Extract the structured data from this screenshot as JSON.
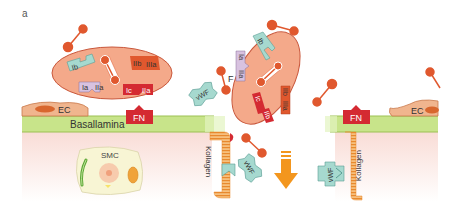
{
  "panel_label": "a",
  "colors": {
    "platelet_fill": "#f4a98a",
    "platelet_stroke": "#c9573b",
    "basallamina": "#c8e48a",
    "fibrinogen": "#e0582e",
    "vwf": "#a6d9cf",
    "fn": "#d42a32",
    "ec": "#f0b58e",
    "collagen": "#f0a24b",
    "arrow": "#f3961e",
    "subendothel": "#fbe9e6",
    "smc": "#f8f5d4"
  },
  "platelet_left": {
    "receptors": {
      "Ib": "Ib",
      "IaIIa_a": "Ia",
      "IaIIa_b": "IIa",
      "IcIIa_a": "Ic",
      "IcIIa_b": "IIa",
      "IIbIIIa_a": "IIb",
      "IIbIIIa_b": "IIIa"
    }
  },
  "platelet_right": {
    "receptors": {
      "Ib": "Ib",
      "IaIIa_a": "Ia",
      "IaIIa_b": "IIa",
      "IcIIa_a": "Ic",
      "IcIIa_b": "IIb",
      "IIbIIIa_a": "IIb",
      "IIbIIIa_b": "IIIa"
    }
  },
  "labels": {
    "fibrinogen": "F",
    "vwf": "vWF",
    "fn": "FN",
    "ec": "EC",
    "basallamina": "Basallamina",
    "smc": "SMC",
    "kollagen": "Kollagen"
  }
}
